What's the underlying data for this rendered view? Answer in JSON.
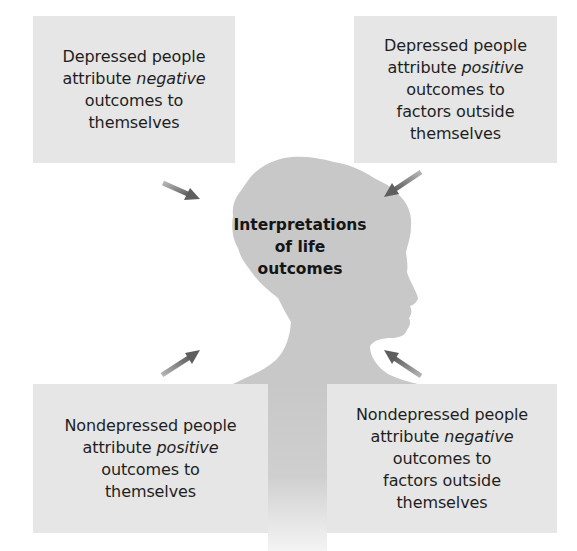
{
  "diagram": {
    "center": {
      "lines": [
        "Interpretations",
        "of life",
        "outcomes"
      ],
      "icon": "head-silhouette-icon"
    },
    "boxes": [
      {
        "id": "top-left",
        "line1": "Depressed people",
        "line2_pre": "attribute ",
        "line2_em": "negative",
        "line3": "outcomes to",
        "line4": "themselves",
        "line5": ""
      },
      {
        "id": "top-right",
        "line1": "Depressed people",
        "line2_pre": "attribute ",
        "line2_em": "positive",
        "line3": "outcomes to",
        "line4": "factors outside",
        "line5": "themselves"
      },
      {
        "id": "bottom-left",
        "line1": "Nondepressed people",
        "line2_pre": "attribute ",
        "line2_em": "positive",
        "line3": "outcomes to",
        "line4": "themselves",
        "line5": ""
      },
      {
        "id": "bottom-right",
        "line1": "Nondepressed people",
        "line2_pre": "attribute ",
        "line2_em": "negative",
        "line3": "outcomes to",
        "line4": "factors outside",
        "line5": "themselves"
      }
    ],
    "arrows": [
      {
        "from": "top-left",
        "to": "center",
        "icon": "arrow-down-right-icon"
      },
      {
        "from": "top-right",
        "to": "center",
        "icon": "arrow-down-left-icon"
      },
      {
        "from": "bottom-left",
        "to": "center",
        "icon": "arrow-up-right-icon"
      },
      {
        "from": "bottom-right",
        "to": "center",
        "icon": "arrow-up-left-icon"
      }
    ],
    "colors": {
      "box_fill": "#e6e6e6",
      "silhouette": "#c8c8c8",
      "arrow": "#6e6e6e",
      "text": "#1e1e1e"
    }
  }
}
